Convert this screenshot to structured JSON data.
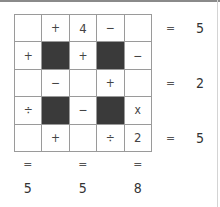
{
  "puzzle": {
    "grid": [
      [
        {
          "text": "",
          "dark": false
        },
        {
          "text": "+",
          "dark": false
        },
        {
          "text": "4",
          "dark": false
        },
        {
          "text": "−",
          "dark": false
        },
        {
          "text": "",
          "dark": false
        }
      ],
      [
        {
          "text": "+",
          "dark": false
        },
        {
          "text": "",
          "dark": true
        },
        {
          "text": "+",
          "dark": false
        },
        {
          "text": "",
          "dark": true
        },
        {
          "text": "−",
          "dark": false
        }
      ],
      [
        {
          "text": "",
          "dark": false
        },
        {
          "text": "−",
          "dark": false
        },
        {
          "text": "",
          "dark": false
        },
        {
          "text": "+",
          "dark": false
        },
        {
          "text": "",
          "dark": false
        }
      ],
      [
        {
          "text": "÷",
          "dark": false
        },
        {
          "text": "",
          "dark": true
        },
        {
          "text": "−",
          "dark": false
        },
        {
          "text": "",
          "dark": true
        },
        {
          "text": "x",
          "dark": false
        }
      ],
      [
        {
          "text": "",
          "dark": false
        },
        {
          "text": "+",
          "dark": false
        },
        {
          "text": "",
          "dark": false
        },
        {
          "text": "÷",
          "dark": false
        },
        {
          "text": "2",
          "dark": false
        }
      ]
    ],
    "row_results": [
      {
        "row": 0,
        "eq": "=",
        "value": "5"
      },
      {
        "row": 2,
        "eq": "=",
        "value": "2"
      },
      {
        "row": 4,
        "eq": "=",
        "value": "5"
      }
    ],
    "col_results": [
      {
        "col": 0,
        "eq": "=",
        "value": "5"
      },
      {
        "col": 2,
        "eq": "=",
        "value": "5"
      },
      {
        "col": 4,
        "eq": "=",
        "value": "8"
      }
    ]
  }
}
